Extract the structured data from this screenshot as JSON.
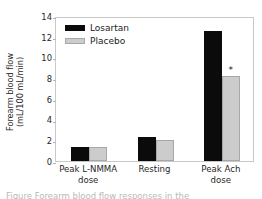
{
  "chart_data": {
    "type": "bar",
    "title": "",
    "xlabel": "",
    "ylabel": "Forearm blood flow",
    "ylabel_line2": "(mL/100 mL/min)",
    "ylim": [
      0,
      14
    ],
    "yticks": [
      14,
      12,
      10,
      8,
      6,
      4,
      2,
      0
    ],
    "grid": false,
    "legend_position": "top-left",
    "categories": [
      "Peak L-NMMA dose",
      "Resting",
      "Peak Ach dose"
    ],
    "category_lines": [
      [
        "Peak L-NMMA",
        "dose"
      ],
      [
        "Resting",
        ""
      ],
      [
        "Peak Ach",
        "dose"
      ]
    ],
    "series": [
      {
        "name": "Losartan",
        "color": "#0b0b0b",
        "values": [
          1.4,
          2.3,
          12.55
        ]
      },
      {
        "name": "Placebo",
        "color": "#cccccc",
        "values": [
          1.4,
          2.0,
          8.2
        ]
      }
    ],
    "annotations": [
      {
        "text": "*",
        "series": "Placebo",
        "category": "Peak Ach dose",
        "value": 8.2
      }
    ]
  },
  "legend": {
    "items": [
      {
        "label": "Losartan",
        "swatch": "losartan"
      },
      {
        "label": "Placebo",
        "swatch": "placebo"
      }
    ]
  },
  "caption": {
    "sliver_text": "Figure   Forearm blood flow responses in the"
  }
}
